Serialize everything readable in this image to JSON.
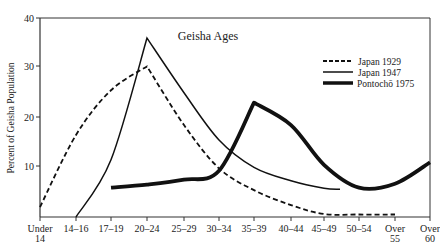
{
  "chart_data": {
    "type": "line",
    "title": "Geisha Ages",
    "xlabel": "",
    "ylabel": "Percent of Geisha Population",
    "ylim": [
      0,
      40
    ],
    "yticks": [
      10,
      20,
      30,
      40
    ],
    "grid": false,
    "legend_position": "upper right",
    "categories": [
      "Under 14",
      "14–16",
      "17–19",
      "20–24",
      "25–29",
      "30–34",
      "35–39",
      "40–44",
      "45–49",
      "50–54",
      "Over 55",
      "Over 60"
    ],
    "series": [
      {
        "name": "Japan 1929",
        "style": "dashed",
        "values": [
          2,
          16.5,
          25.5,
          30.3,
          18.5,
          9.8,
          5.4,
          2.4,
          0.6,
          0.5,
          0.5,
          null
        ]
      },
      {
        "name": "Japan 1947",
        "style": "thin-solid",
        "values": [
          null,
          0,
          11.5,
          36,
          25,
          15.5,
          10,
          7.3,
          5.8,
          5.6,
          null,
          null
        ]
      },
      {
        "name": "Pontochō 1975",
        "style": "thick-solid",
        "values": [
          null,
          null,
          5.9,
          6.5,
          7.5,
          9.3,
          23,
          18.5,
          10.5,
          5.9,
          6.7,
          11
        ]
      }
    ]
  },
  "legend": {
    "items": [
      {
        "label": "Japan 1929"
      },
      {
        "label": "Japan 1947"
      },
      {
        "label": "Pontochō 1975"
      }
    ]
  },
  "axis": {
    "x_labels": [
      {
        "line1": "Under",
        "line2": "14"
      },
      {
        "line1": "14–16",
        "line2": ""
      },
      {
        "line1": "17–19",
        "line2": ""
      },
      {
        "line1": "20–24",
        "line2": ""
      },
      {
        "line1": "25–29",
        "line2": ""
      },
      {
        "line1": "30–34",
        "line2": ""
      },
      {
        "line1": "35–39",
        "line2": ""
      },
      {
        "line1": "40–44",
        "line2": ""
      },
      {
        "line1": "45–49",
        "line2": ""
      },
      {
        "line1": "50–54",
        "line2": ""
      },
      {
        "line1": "Over",
        "line2": "55"
      },
      {
        "line1": "Over",
        "line2": "60"
      }
    ],
    "y_labels": [
      "10",
      "20",
      "30",
      "40"
    ]
  }
}
